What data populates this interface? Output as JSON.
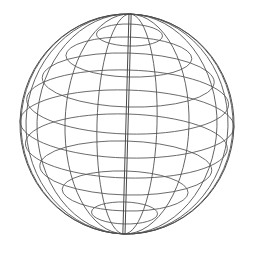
{
  "figure": {
    "kind": "wireframe-sphere",
    "caption": ""
  },
  "canvas": {
    "width": 256,
    "height": 256,
    "background_color": "#ffffff"
  },
  "style": {
    "line_color": "#555555",
    "meridian_color": "#525252",
    "parallel_color": "#5a5a5a",
    "axis_color": "#4a4a4a",
    "outline_color": "#4f4f4f",
    "line_width": 0.9
  },
  "chart_data": {
    "type": "scatter",
    "xlabel": "",
    "ylabel": "",
    "geometry": {
      "center_x": 127,
      "center_y": 124,
      "radius_x": 107,
      "radius_y": 110,
      "tilt_degrees": 2,
      "pole_top_y": 14,
      "pole_bottom_y": 234,
      "left_edge_x": 20,
      "right_edge_x": 234
    },
    "parallels": {
      "count": 9,
      "latitudes_degrees": [
        72,
        54,
        36,
        18,
        0,
        -18,
        -36,
        -54,
        -72
      ],
      "center_y": [
        35,
        57,
        80,
        102,
        124,
        146,
        168,
        191,
        213
      ],
      "semi_axis_x": [
        33,
        63,
        86,
        101,
        107,
        101,
        86,
        63,
        33
      ],
      "semi_axis_y": [
        11,
        20,
        27,
        32,
        34,
        32,
        27,
        20,
        11
      ]
    },
    "meridians": {
      "count": 7,
      "longitudes_degrees": [
        0,
        26,
        51,
        77,
        103,
        129,
        154
      ],
      "semi_axis_x": [
        2,
        30,
        62,
        90,
        101,
        106,
        107
      ],
      "semi_axis_y": 110
    },
    "legend": [],
    "annotations": []
  }
}
